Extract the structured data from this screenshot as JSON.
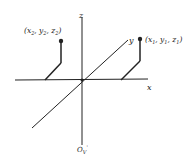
{
  "diagram": {
    "type": "3d-coordinate-axes",
    "axes": {
      "x_label": "x",
      "y_label": "y",
      "z_label": "z"
    },
    "points": [
      {
        "id": "point-2",
        "label": "(x",
        "sub_x": "2",
        "label_y": ", y",
        "sub_y": "2",
        "label_z": ", z",
        "sub_z": "2",
        "label_end": ")"
      },
      {
        "id": "point-1",
        "label": "(x",
        "sub_x": "1",
        "label_y": ", y",
        "sub_y": "1",
        "label_z": ", z",
        "sub_z": "1",
        "label_end": ")"
      }
    ],
    "origin_label": "O",
    "origin_sub": "V",
    "origin_prime": "'",
    "colors": {
      "stroke": "#222222",
      "background": "#ffffff"
    }
  }
}
